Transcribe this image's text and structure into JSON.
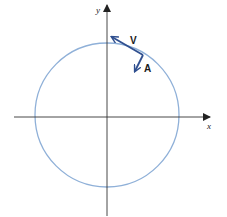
{
  "diagram": {
    "type": "uniform circular motion",
    "axes": {
      "x_label": "x",
      "y_label": "y"
    },
    "circle": {
      "color": "#8fb0d8"
    },
    "vectors": [
      {
        "name": "velocity",
        "label": "V",
        "color": "#2f4f8f"
      },
      {
        "name": "acceleration",
        "label": "A",
        "color": "#2f4f8f"
      }
    ],
    "colors": {
      "axis": "#333333",
      "circle": "#8fb0d8",
      "vector": "#2f4f8f"
    }
  }
}
